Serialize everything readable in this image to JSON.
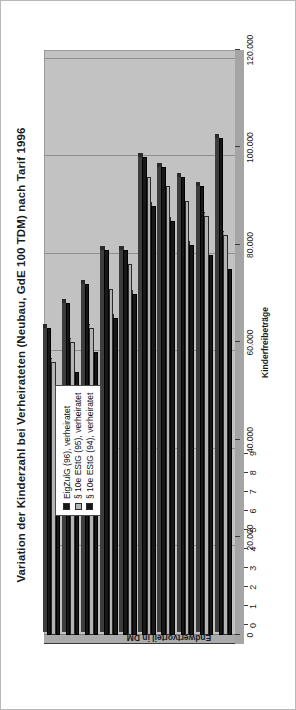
{
  "chart_data": {
    "type": "bar",
    "orientation": "vertical-bars-page-rotated-90",
    "title": "Variation der Kinderzahl bei Verheirateten (Neubau, GdE 100 TDM) nach Tarif 1996",
    "xlabel": "Kinderfreibeträge",
    "ylabel": "Endwertvorteil in DM",
    "categories": [
      "0",
      "1",
      "2",
      "3",
      "4",
      "5",
      "6",
      "7",
      "8",
      "9"
    ],
    "ylim": [
      0,
      120000
    ],
    "yticks": [
      0,
      20000,
      40000,
      60000,
      80000,
      100000,
      120000
    ],
    "ytick_labels": [
      "0",
      "20.000",
      "40.000",
      "60.000",
      "80.000",
      "100.000",
      "120.000"
    ],
    "grid": true,
    "legend_position": "upper-left-inside",
    "series": [
      {
        "name": "EigZulG (96), verheiratet",
        "color": "#171717",
        "values": [
          63000,
          68000,
          72000,
          79000,
          79000,
          98000,
          96000,
          94000,
          92000,
          102000
        ]
      },
      {
        "name": "§ 10e EStG (95), verheiratet",
        "color": "#b4b4b4",
        "values": [
          56000,
          60000,
          63000,
          71000,
          76000,
          94000,
          92000,
          89000,
          86000,
          82000
        ]
      },
      {
        "name": "§ 10e EStG (94), verheiratet",
        "color": "#171717",
        "values": [
          50000,
          54000,
          58000,
          65000,
          70000,
          88000,
          85000,
          80000,
          78000,
          75000
        ]
      }
    ]
  },
  "legend": {
    "items": [
      {
        "label": "EigZulG (96), verheiratet",
        "swatch": "#171717"
      },
      {
        "label": "§ 10e EStG (95), verheiratet",
        "swatch": "#b4b4b4"
      },
      {
        "label": "§ 10e EStG (94), verheiratet",
        "swatch": "#171717"
      }
    ]
  },
  "colors": {
    "plot_background": "#c2c2c2",
    "plot_side": "#ababab",
    "gridline": "#8e8e8e",
    "axis": "#3a3a3a",
    "page_background": "#fdfdfd",
    "text": "#1b1b1b"
  }
}
